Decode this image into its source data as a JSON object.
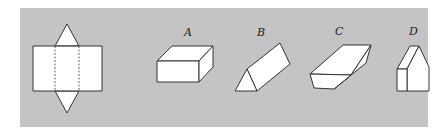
{
  "figure": {
    "background": "#ffffff",
    "panel_color": "#c4c4c4",
    "shape_fill": "#ffffff",
    "stroke_color": "#333333",
    "net": {
      "description": "net of a triangular prism: rectangle with two dashed fold lines and triangles on top and bottom"
    },
    "options": [
      {
        "label": "A",
        "shape": "rectangular box (cuboid)"
      },
      {
        "label": "B",
        "shape": "triangular prism"
      },
      {
        "label": "C",
        "shape": "slanted prism with trapezoidal end"
      },
      {
        "label": "D",
        "shape": "pentagonal (house-shaped) prism"
      }
    ]
  }
}
